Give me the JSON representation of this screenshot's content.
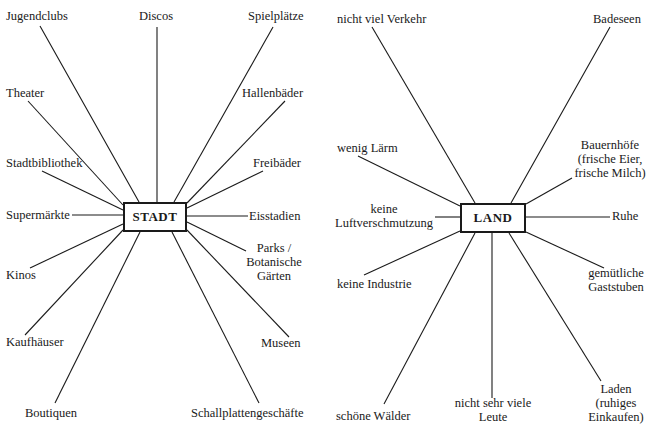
{
  "stadt": {
    "center_label": "STADT",
    "items": {
      "jugendclubs": "Jugendclubs",
      "discos": "Discos",
      "spielplaetze": "Spielplätze",
      "theater": "Theater",
      "hallenbaeder": "Hallenbäder",
      "stadtbibliothek": "Stadtbibliothek",
      "freibaeder": "Freibäder",
      "supermaerkte": "Supermärkte",
      "eisstadien": "Eisstadien",
      "kinos": "Kinos",
      "parks_1": "Parks /",
      "parks_2": "Botanische",
      "parks_3": "Gärten",
      "kaufhaeuser": "Kaufhäuser",
      "museen": "Museen",
      "boutiquen": "Boutiquen",
      "schallplattengeschaefte": "Schallplattengeschäfte"
    }
  },
  "land": {
    "center_label": "LAND",
    "items": {
      "verkehr": "nicht viel Verkehr",
      "badeseen": "Badeseen",
      "laerm": "wenig Lärm",
      "bauernhoefe_1": "Bauernhöfe",
      "bauernhoefe_2": "(frische Eier,",
      "bauernhoefe_3": "frische Milch)",
      "luft_1": "keine",
      "luft_2": "Luftverschmutzung",
      "ruhe": "Ruhe",
      "industrie": "keine Industrie",
      "gaststuben_1": "gemütliche",
      "gaststuben_2": "Gaststuben",
      "waelder": "schöne Wälder",
      "leute_1": "nicht sehr viele",
      "leute_2": "Leute",
      "laden_1": "Laden",
      "laden_2": "(ruhiges",
      "laden_3": "Einkaufen)"
    }
  },
  "colors": {
    "ink": "#1a1a1a",
    "background": "#ffffff"
  }
}
